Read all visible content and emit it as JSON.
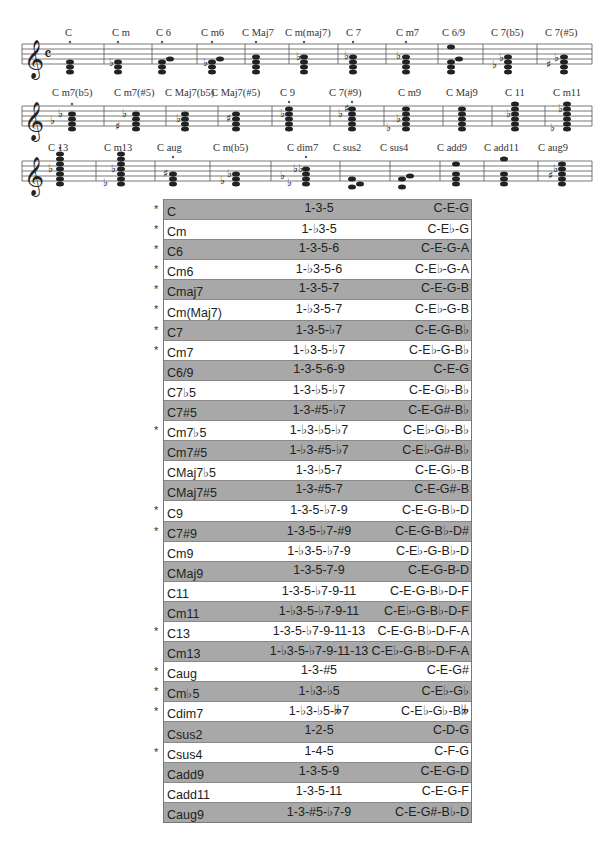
{
  "staves": [
    {
      "chords": [
        {
          "label": "C",
          "x": 68,
          "marked": true
        },
        {
          "label": "C m",
          "x": 117,
          "marked": true
        },
        {
          "label": "C 6",
          "x": 162,
          "marked": true
        },
        {
          "label": "C m6",
          "x": 210,
          "marked": true
        },
        {
          "label": "C Maj7",
          "x": 255,
          "marked": true
        },
        {
          "label": "C m(maj7)",
          "x": 302,
          "marked": true
        },
        {
          "label": "C 7",
          "x": 352,
          "marked": true
        },
        {
          "label": "C m7",
          "x": 404,
          "marked": true
        },
        {
          "label": "C 6/9",
          "x": 446,
          "marked": false
        },
        {
          "label": "C 7(b5)",
          "x": 505,
          "marked": false
        },
        {
          "label": "C 7(#5)",
          "x": 560,
          "marked": false
        }
      ]
    },
    {
      "chords": [
        {
          "label": "C m7(b5)",
          "x": 70,
          "marked": true
        },
        {
          "label": "C m7(#5)",
          "x": 125,
          "marked": false
        },
        {
          "label": "C Maj7(b5)",
          "x": 171,
          "marked": false
        },
        {
          "label": "C Maj7(#5)",
          "x": 226,
          "marked": false
        },
        {
          "label": "C 9",
          "x": 285,
          "marked": true
        },
        {
          "label": "C 7(#9)",
          "x": 346,
          "marked": true
        },
        {
          "label": "C m9",
          "x": 408,
          "marked": false
        },
        {
          "label": "C Maj9",
          "x": 457,
          "marked": false
        },
        {
          "label": "C 11",
          "x": 510,
          "marked": false
        },
        {
          "label": "C m11",
          "x": 563,
          "marked": false
        }
      ]
    },
    {
      "chords": [
        {
          "label": "C 13",
          "x": 60,
          "marked": true
        },
        {
          "label": "C m13",
          "x": 116,
          "marked": false
        },
        {
          "label": "C aug",
          "x": 168,
          "marked": true
        },
        {
          "label": "C m(b5)",
          "x": 223,
          "marked": false
        },
        {
          "label": "C dim7",
          "x": 299,
          "marked": true
        },
        {
          "label": "C sus2",
          "x": 348,
          "marked": false
        },
        {
          "label": "C sus4",
          "x": 396,
          "marked": false
        },
        {
          "label": "C add9",
          "x": 446,
          "marked": false
        },
        {
          "label": "C add11",
          "x": 492,
          "marked": false
        },
        {
          "label": "C aug9",
          "x": 547,
          "marked": false
        }
      ]
    }
  ],
  "table": {
    "rows": [
      {
        "name": "C",
        "formula": "1-3-5",
        "notes": "C-E-G",
        "star": true
      },
      {
        "name": "Cm",
        "formula": "1-♭3-5",
        "notes": "C-E♭-G",
        "star": true
      },
      {
        "name": "C6",
        "formula": "1-3-5-6",
        "notes": "C-E-G-A",
        "star": true
      },
      {
        "name": "Cm6",
        "formula": "1-♭3-5-6",
        "notes": "C-E♭-G-A",
        "star": true
      },
      {
        "name": "Cmaj7",
        "formula": "1-3-5-7",
        "notes": "C-E-G-B",
        "star": true
      },
      {
        "name": "Cm(Maj7)",
        "formula": "1-♭3-5-7",
        "notes": "C-E♭-G-B",
        "star": true
      },
      {
        "name": "C7",
        "formula": "1-3-5-♭7",
        "notes": "C-E-G-B♭",
        "star": true
      },
      {
        "name": "Cm7",
        "formula": "1-♭3-5-♭7",
        "notes": "C-E♭-G-B♭",
        "star": true
      },
      {
        "name": "C6/9",
        "formula": "1-3-5-6-9",
        "notes": "C-E-G",
        "star": false
      },
      {
        "name": "C7♭5",
        "formula": "1-3-♭5-♭7",
        "notes": "C-E-G♭-B♭",
        "star": false
      },
      {
        "name": "C7#5",
        "formula": "1-3-#5-♭7",
        "notes": "C-E-G#-B♭",
        "star": false
      },
      {
        "name": "Cm7♭5",
        "formula": "1-♭3-♭5-♭7",
        "notes": "C-E♭-G♭-B♭",
        "star": true
      },
      {
        "name": "Cm7#5",
        "formula": "1-♭3-#5-♭7",
        "notes": "C-E♭-G#-B♭",
        "star": false
      },
      {
        "name": "CMaj7♭5",
        "formula": "1-3-♭5-7",
        "notes": "C-E-G♭-B",
        "star": false
      },
      {
        "name": "CMaj7#5",
        "formula": "1-3-#5-7",
        "notes": "C-E-G#-B",
        "star": false
      },
      {
        "name": "C9",
        "formula": "1-3-5-♭7-9",
        "notes": "C-E-G-B♭-D",
        "star": true
      },
      {
        "name": "C7#9",
        "formula": "1-3-5-♭7-#9",
        "notes": "C-E-G-B♭-D#",
        "star": true
      },
      {
        "name": "Cm9",
        "formula": "1-♭3-5-♭7-9",
        "notes": "C-E♭-G-B♭-D",
        "star": false
      },
      {
        "name": "CMaj9",
        "formula": "1-3-5-7-9",
        "notes": "C-E-G-B-D",
        "star": false
      },
      {
        "name": "C11",
        "formula": "1-3-5-♭7-9-11",
        "notes": "C-E-G-B♭-D-F",
        "star": false
      },
      {
        "name": "Cm11",
        "formula": "1-♭3-5-♭7-9-11",
        "notes": "C-E♭-G-B♭-D-F",
        "star": false
      },
      {
        "name": "C13",
        "formula": "1-3-5-♭7-9-11-13",
        "notes": "C-E-G-B♭-D-F-A",
        "star": true
      },
      {
        "name": "Cm13",
        "formula": "1-♭3-5-♭7-9-11-13",
        "notes": "C-E♭-G-B♭-D-F-A",
        "star": false
      },
      {
        "name": "Caug",
        "formula": "1-3-#5",
        "notes": "C-E-G#",
        "star": true
      },
      {
        "name": "Cm♭5",
        "formula": "1-♭3-♭5",
        "notes": "C-E♭-G♭",
        "star": true
      },
      {
        "name": "Cdim7",
        "formula": "1-♭3-♭5-𝄫7",
        "notes": "C-E♭-G♭-B𝄫",
        "star": true
      },
      {
        "name": "Csus2",
        "formula": "1-2-5",
        "notes": "C-D-G",
        "star": false
      },
      {
        "name": "Csus4",
        "formula": "1-4-5",
        "notes": "C-F-G",
        "star": true
      },
      {
        "name": "Cadd9",
        "formula": "1-3-5-9",
        "notes": "C-E-G-D",
        "star": false
      },
      {
        "name": "Cadd11",
        "formula": "1-3-5-11",
        "notes": "C-E-G-F",
        "star": false
      },
      {
        "name": "Caug9",
        "formula": "1-3-#5-♭7-9",
        "notes": "C-E-G#-B♭-D",
        "star": false
      }
    ],
    "star_symbol": "*",
    "colors": {
      "shaded": "#a8a8a8",
      "plain": "#ffffff",
      "border": "#888888"
    }
  },
  "icons": {
    "treble_clef": "𝄞",
    "common_time": "𝄴",
    "flat": "♭",
    "sharp": "♯"
  }
}
